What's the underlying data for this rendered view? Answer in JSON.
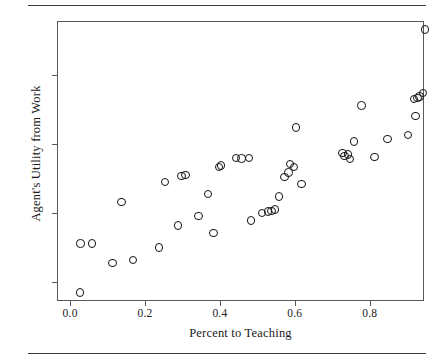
{
  "figure": {
    "has_top_rule": true,
    "has_bottom_rule": true,
    "frame_color": "#555a5e",
    "marker_color": "#141414",
    "background": "#ffffff"
  },
  "chart_data": {
    "type": "scatter",
    "title": "",
    "xlabel": "Percent to Teaching",
    "ylabel": "Agent's Utility from Work",
    "xlim": [
      -0.035,
      0.945
    ],
    "ylim": [
      0.72,
      4.78
    ],
    "xticks": [
      0.0,
      0.2,
      0.4,
      0.6,
      0.8
    ],
    "xticklabels": [
      "0.0",
      "0.2",
      "0.4",
      "0.6",
      "0.8"
    ],
    "yticks": [
      1,
      2,
      3,
      4
    ],
    "yticklabels": [
      "1",
      "2",
      "3",
      "4"
    ],
    "grid": false,
    "legend": null,
    "marker": "open-circle",
    "n_points": 46,
    "points": [
      {
        "x": 0.024,
        "y": 0.86
      },
      {
        "x": 0.025,
        "y": 1.57
      },
      {
        "x": 0.055,
        "y": 1.57
      },
      {
        "x": 0.11,
        "y": 1.29
      },
      {
        "x": 0.135,
        "y": 2.17
      },
      {
        "x": 0.165,
        "y": 1.33
      },
      {
        "x": 0.235,
        "y": 1.51
      },
      {
        "x": 0.25,
        "y": 2.46
      },
      {
        "x": 0.285,
        "y": 1.83
      },
      {
        "x": 0.295,
        "y": 2.55
      },
      {
        "x": 0.34,
        "y": 1.97
      },
      {
        "x": 0.365,
        "y": 2.29
      },
      {
        "x": 0.38,
        "y": 1.72
      },
      {
        "x": 0.395,
        "y": 2.68
      },
      {
        "x": 0.44,
        "y": 2.81
      },
      {
        "x": 0.455,
        "y": 2.8
      },
      {
        "x": 0.475,
        "y": 2.81
      },
      {
        "x": 0.48,
        "y": 1.9
      },
      {
        "x": 0.51,
        "y": 2.01
      },
      {
        "x": 0.535,
        "y": 2.04
      },
      {
        "x": 0.545,
        "y": 2.06
      },
      {
        "x": 0.555,
        "y": 2.25
      },
      {
        "x": 0.57,
        "y": 2.53
      },
      {
        "x": 0.58,
        "y": 2.6
      },
      {
        "x": 0.585,
        "y": 2.72
      },
      {
        "x": 0.6,
        "y": 3.25
      },
      {
        "x": 0.615,
        "y": 2.43
      },
      {
        "x": 0.725,
        "y": 2.88
      },
      {
        "x": 0.74,
        "y": 2.86
      },
      {
        "x": 0.745,
        "y": 2.79
      },
      {
        "x": 0.755,
        "y": 3.05
      },
      {
        "x": 0.775,
        "y": 3.57
      },
      {
        "x": 0.81,
        "y": 2.82
      },
      {
        "x": 0.845,
        "y": 3.08
      },
      {
        "x": 0.9,
        "y": 3.14
      },
      {
        "x": 0.915,
        "y": 3.66
      },
      {
        "x": 0.92,
        "y": 3.42
      },
      {
        "x": 0.93,
        "y": 3.7
      },
      {
        "x": 0.94,
        "y": 3.75
      },
      {
        "x": 0.945,
        "y": 4.67
      },
      {
        "x": 0.525,
        "y": 2.03
      },
      {
        "x": 0.4,
        "y": 2.7
      },
      {
        "x": 0.305,
        "y": 2.56
      },
      {
        "x": 0.595,
        "y": 2.68
      },
      {
        "x": 0.73,
        "y": 2.84
      },
      {
        "x": 0.925,
        "y": 3.68
      }
    ]
  }
}
